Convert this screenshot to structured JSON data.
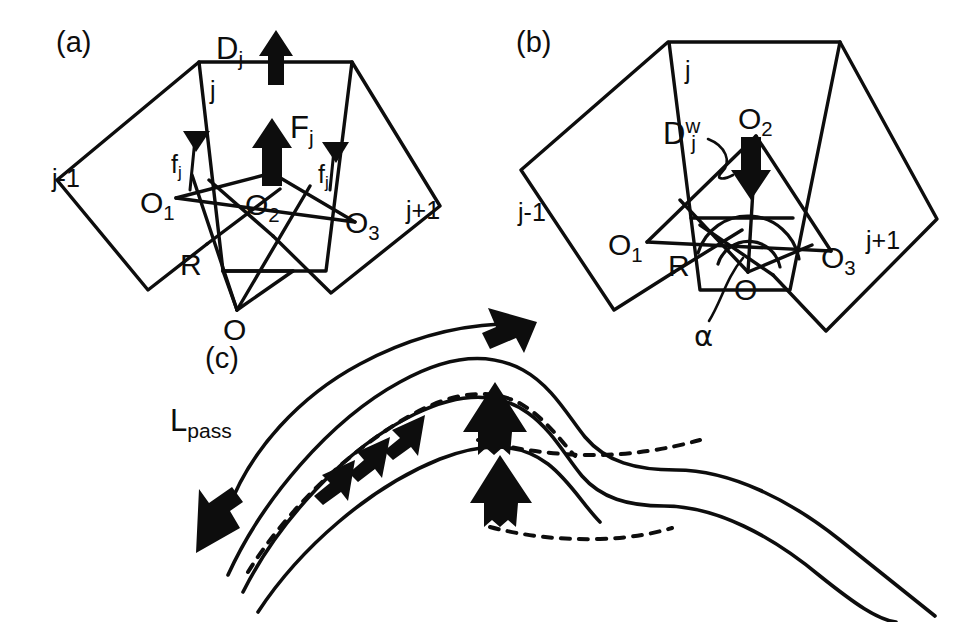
{
  "figure": {
    "background_color": "#ffffff",
    "ink_color": "#0d0d0d",
    "width": 978,
    "height": 622
  },
  "panels": [
    {
      "id": "a",
      "tag": "(a)",
      "description": "Fan of three trapezoidal plates j-1, j, j+1 hinged about pivot O, with driving force D_j, resultant F_j and friction forces f_j",
      "labels": {
        "plate_prev": "j-1",
        "plate_center": "j",
        "plate_next": "j+1",
        "node_o1": "O",
        "node_o1_sub": "1",
        "node_o2": "O",
        "node_o2_sub": "2",
        "node_o3": "O",
        "node_o3_sub": "3",
        "node_r": "R",
        "node_o": "O",
        "force_d": "D",
        "force_d_sub": "j",
        "force_f_big": "F",
        "force_f_big_sub": "j",
        "force_f_left": "f",
        "force_f_left_sub": "j",
        "force_f_right": "f",
        "force_f_right_sub": "j"
      }
    },
    {
      "id": "b",
      "tag": "(b)",
      "description": "Same plate fan showing downward wedge driving force D_j^w at O_2 and the opening angle alpha at pivot O",
      "labels": {
        "plate_prev": "j-1",
        "plate_center": "j",
        "plate_next": "j+1",
        "node_o1": "O",
        "node_o1_sub": "1",
        "node_o2": "O",
        "node_o2_sub": "2",
        "node_o3": "O",
        "node_o3_sub": "3",
        "node_r": "R",
        "node_o": "O",
        "force_dw": "D",
        "force_dw_sub": "j",
        "force_dw_sup": "w",
        "angle_alpha": "α"
      }
    },
    {
      "id": "c",
      "tag": "(c)",
      "description": "Two stacked folded layers with a double-headed arrow labelled L_pass along the limb, thick block arrows showing uplift at crests and small arrows along the dashed detachment",
      "labels": {
        "length_l": "L",
        "length_l_sub": "pass"
      }
    }
  ],
  "geometry": {
    "panel_a": {
      "plate_j_outline": "200,63 352,62 346,183 207,186",
      "plate_jm1_outline": "200,63 60,179 106,277 207,186",
      "plate_jp1_outline": "352,62 430,205 330,291 346,183",
      "inner_triangle": "O1-O2-O3 fan about O"
    },
    "panel_b": {
      "plate_j_outline": "670,42 845,44 830,192 685,190",
      "plate_jm1_outline": "670,42 522,170 560,308 685,190",
      "plate_jp1_outline": "845,44 938,218 830,330 830,192"
    }
  },
  "arrows": {
    "panel_a_D_j": {
      "direction": "up",
      "style": "thick-block"
    },
    "panel_a_F_j": {
      "direction": "up",
      "style": "thick-block"
    },
    "panel_a_f_j_left": {
      "direction": "up-left",
      "style": "thin-with-solid-head"
    },
    "panel_a_f_j_right": {
      "direction": "up-right",
      "style": "thin-with-solid-head"
    },
    "panel_b_Dw_j": {
      "direction": "down",
      "style": "thick-block"
    },
    "panel_c_Lpass": {
      "direction": "double-headed",
      "style": "curved-line-with-solid-heads"
    },
    "panel_c_uplift": {
      "count": 2,
      "direction": "up",
      "style": "thick-block"
    },
    "panel_c_slip": {
      "count": 3,
      "direction": "up-left",
      "style": "small-block"
    }
  }
}
